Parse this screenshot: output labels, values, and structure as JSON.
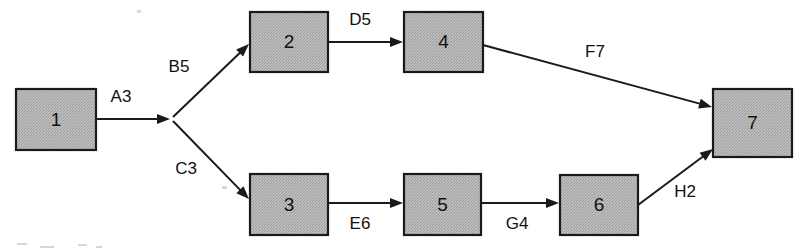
{
  "diagram": {
    "type": "activity-on-node-network",
    "background_color": "#ffffff",
    "node_fill_color": "#b5b5b5",
    "node_border_color": "#1a1a1a",
    "edge_color": "#1a1a1a",
    "text_color": "#111111",
    "nodes": [
      {
        "id": "1",
        "label": "1",
        "x": 16,
        "y": 89,
        "w": 80,
        "h": 61
      },
      {
        "id": "2",
        "label": "2",
        "x": 250,
        "y": 12,
        "w": 78,
        "h": 60
      },
      {
        "id": "3",
        "label": "3",
        "x": 250,
        "y": 174,
        "w": 78,
        "h": 61
      },
      {
        "id": "4",
        "label": "4",
        "x": 404,
        "y": 12,
        "w": 79,
        "h": 60
      },
      {
        "id": "5",
        "label": "5",
        "x": 404,
        "y": 174,
        "w": 77,
        "h": 61
      },
      {
        "id": "6",
        "label": "6",
        "x": 560,
        "y": 175,
        "w": 78,
        "h": 60
      },
      {
        "id": "7",
        "label": "7",
        "x": 713,
        "y": 89,
        "w": 79,
        "h": 68
      }
    ],
    "edges": [
      {
        "id": "A3",
        "label": "A3",
        "from": "1",
        "to": "junction",
        "label_x": 121,
        "label_y": 98,
        "x1": 96,
        "y1": 119,
        "x2": 170,
        "y2": 119,
        "arrow": true
      },
      {
        "id": "B5",
        "label": "B5",
        "from": "junction",
        "to": "2",
        "label_x": 179,
        "label_y": 68,
        "x1": 173,
        "y1": 117,
        "x2": 249,
        "y2": 44,
        "arrow": true
      },
      {
        "id": "C3",
        "label": "C3",
        "from": "junction",
        "to": "3",
        "label_x": 186,
        "label_y": 170,
        "x1": 173,
        "y1": 121,
        "x2": 249,
        "y2": 199,
        "arrow": true
      },
      {
        "id": "D5",
        "label": "D5",
        "from": "2",
        "to": "4",
        "label_x": 360,
        "label_y": 21,
        "x1": 328,
        "y1": 42,
        "x2": 403,
        "y2": 42,
        "arrow": true
      },
      {
        "id": "E6",
        "label": "E6",
        "from": "3",
        "to": "5",
        "label_x": 360,
        "label_y": 225,
        "x1": 328,
        "y1": 203,
        "x2": 403,
        "y2": 203,
        "arrow": true
      },
      {
        "id": "F7",
        "label": "F7",
        "from": "4",
        "to": "7",
        "label_x": 595,
        "label_y": 53,
        "x1": 483,
        "y1": 45,
        "x2": 712,
        "y2": 107,
        "arrow": true
      },
      {
        "id": "G4",
        "label": "G4",
        "from": "5",
        "to": "6",
        "label_x": 517,
        "label_y": 225,
        "x1": 481,
        "y1": 203,
        "x2": 559,
        "y2": 203,
        "arrow": true
      },
      {
        "id": "H2",
        "label": "H2",
        "from": "6",
        "to": "7",
        "label_x": 685,
        "label_y": 193,
        "x1": 638,
        "y1": 205,
        "x2": 713,
        "y2": 149,
        "arrow": true
      }
    ],
    "junction": {
      "x": 172,
      "y": 119
    }
  }
}
